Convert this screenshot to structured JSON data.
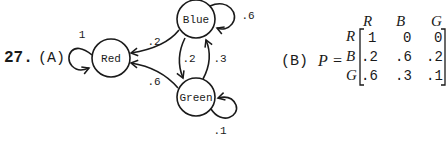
{
  "problem": {
    "number": "27.",
    "part_a_label": "(A)",
    "part_b_label": "(B)",
    "matrix_symbol": "P",
    "equals": "="
  },
  "diagram": {
    "nodes": [
      {
        "id": "red",
        "label": "Red"
      },
      {
        "id": "blue",
        "label": "Blue"
      },
      {
        "id": "green",
        "label": "Green"
      }
    ],
    "edges": [
      {
        "from": "red",
        "to": "red",
        "label": "1"
      },
      {
        "from": "blue",
        "to": "blue",
        "label": ".6"
      },
      {
        "from": "green",
        "to": "green",
        "label": ".1"
      },
      {
        "from": "blue",
        "to": "red",
        "label": ".2"
      },
      {
        "from": "green",
        "to": "red",
        "label": ".6"
      },
      {
        "from": "blue",
        "to": "green",
        "label": ".2"
      },
      {
        "from": "green",
        "to": "blue",
        "label": ".3"
      }
    ]
  },
  "matrix": {
    "col_headers": [
      "R",
      "B",
      "G"
    ],
    "row_headers": [
      "R",
      "B",
      "G"
    ],
    "rows": [
      [
        "1",
        "0",
        "0"
      ],
      [
        ".2",
        ".6",
        ".2"
      ],
      [
        ".6",
        ".3",
        ".1"
      ]
    ]
  }
}
